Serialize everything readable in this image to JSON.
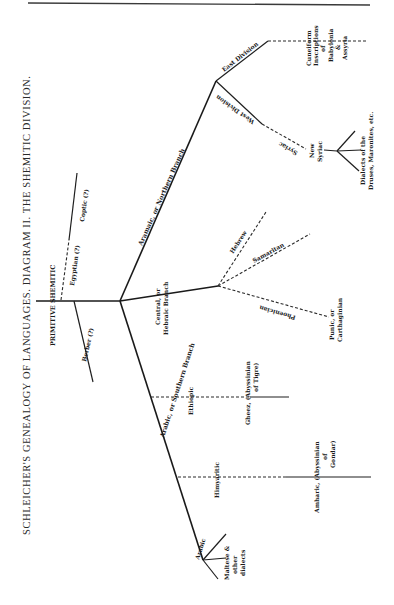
{
  "title": "SCHLEICHER'S GENEALOGY OF LANGUAGES.  DIAGRAM II.  THE SHEMITIC DIVISION.",
  "root": {
    "label": "PRIMITIVE SHEMITIC"
  },
  "uncertain_branches": {
    "egyptian": "Egyptian (?)",
    "coptic": "Coptic (?)",
    "berber": "Berber (?)"
  },
  "northern": {
    "label": "Aramaic, or Northern Branch",
    "east": {
      "label": "East Division",
      "leaf": [
        "Cuneiform",
        "Inscriptions",
        "of",
        "Babylonia",
        "&",
        "Assyria"
      ]
    },
    "west": {
      "label": "West Division",
      "syriac": "Syriac",
      "new_syriac": [
        "New",
        "Syriac"
      ],
      "dialects": [
        "Dialects of the",
        "Druses, Maronites, etc."
      ]
    }
  },
  "central": {
    "label": [
      "Central, or",
      "Hebraic Branch"
    ],
    "hebrew": "Hebrew",
    "samaritan": "Samaritan",
    "phoenician": "Phoenician",
    "punic": [
      "Punic, or",
      "Carthaginian"
    ]
  },
  "southern": {
    "label": "Arabic, or Southern Branch",
    "ethiopic": "Ethiopic",
    "gheez": [
      "Gheez, (Abyssinian",
      "of Tigre)"
    ],
    "himyaritic": "Himyaritic",
    "amharic": [
      "Amharic, (Abyssinian",
      "of",
      "Gondar)"
    ],
    "arabic": "Arabic",
    "maltese": [
      "Maltese &",
      "other",
      "dialects"
    ]
  }
}
